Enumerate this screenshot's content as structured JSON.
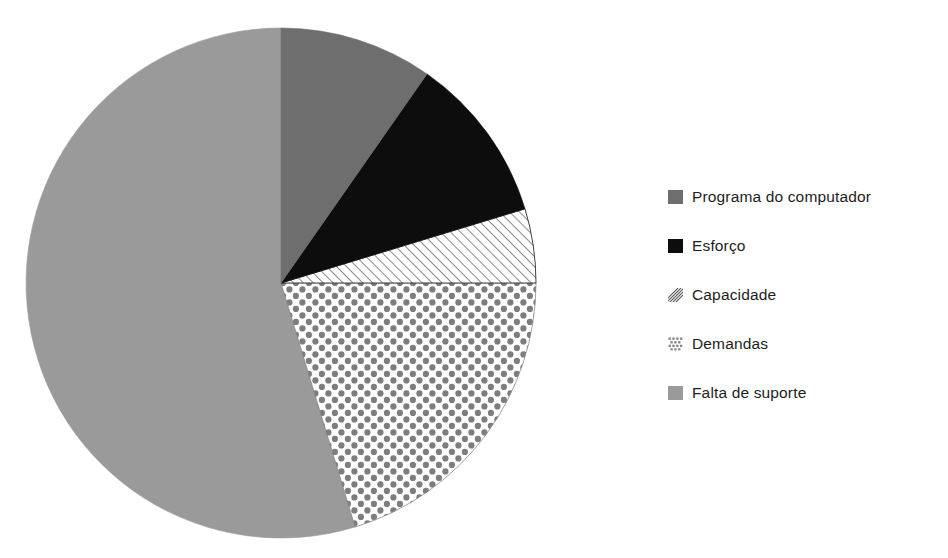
{
  "chart_data": {
    "type": "pie",
    "title": "",
    "subtitle": "",
    "xlabel": "",
    "ylabel": "",
    "grid": false,
    "legend_position": "right",
    "start_angle_deg": 0,
    "direction": "clockwise",
    "categories": [
      "Programa do computador",
      "Esforço",
      "Capacidade",
      "Demandas",
      "Falta de suporte"
    ],
    "values": [
      9.7,
      10.6,
      4.7,
      20.3,
      54.7
    ],
    "slice_angles_deg": [
      35,
      38,
      17,
      73,
      197
    ],
    "slice_styles": [
      "solid-dark-gray",
      "solid-black",
      "diagonal-hatch",
      "dotted-checker",
      "solid-light-gray"
    ],
    "slice_colors": [
      "#6e6e6e",
      "#0d0d0d",
      "#ffffff",
      "#ffffff",
      "#9a9a9a"
    ],
    "pattern_colors": [
      "#6e6e6e",
      "#0d0d0d",
      "#2b2b2b",
      "#7d7d7d",
      "#9a9a9a"
    ],
    "annotations": []
  },
  "legend": {
    "items": [
      {
        "label": "Programa do computador",
        "swatch": "swatch-solid-dark-gray"
      },
      {
        "label": "Esforço",
        "swatch": "swatch-solid-black"
      },
      {
        "label": "Capacidade",
        "swatch": "swatch-diagonal-hatch"
      },
      {
        "label": "Demandas",
        "swatch": "swatch-dotted-checker"
      },
      {
        "label": "Falta de suporte",
        "swatch": "swatch-solid-light-gray"
      }
    ]
  },
  "geometry": {
    "center_x": 281,
    "center_y": 283,
    "radius": 255
  }
}
